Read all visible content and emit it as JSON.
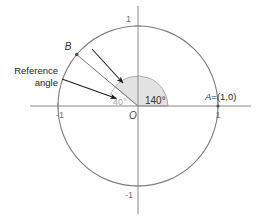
{
  "figure": {
    "colors": {
      "circle_stroke": "#7d7d7d",
      "axis_stroke": "#8a8a8a",
      "sector_fill": "#e2e2e2",
      "sector_stroke": "#8f8f8f",
      "ray_stroke": "#7a7a7a",
      "arrow_stroke": "#1d1d1d",
      "text": "#1d1d1d",
      "tick_text": "#6e6e6e",
      "ref_label_text": "#a8a8a8",
      "background": "#ffffff"
    },
    "geometry": {
      "center_x": 138,
      "center_y": 106,
      "radius": 80,
      "sector_radius": 30,
      "angle_degrees": 140,
      "reference_angle_degrees": 40
    }
  },
  "labels": {
    "tick_top": "1",
    "tick_bottom": "-1",
    "tick_left": "-1",
    "tick_right": "1",
    "origin": "O",
    "point_b": "B",
    "point_a_name": "A",
    "point_a_value": "=(1,0)",
    "angle_main": "140°",
    "angle_reference": "40°",
    "callout_line1": "Reference",
    "callout_line2": "angle"
  }
}
